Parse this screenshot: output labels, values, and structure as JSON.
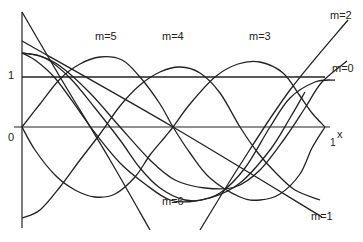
{
  "figure": {
    "axis_labels": {
      "y_one": "1",
      "origin": "0",
      "x_one": "1",
      "x_var": "x"
    },
    "curve_labels": [
      {
        "id": "m5",
        "text": "m=5",
        "x": 95,
        "y": 40
      },
      {
        "id": "m4",
        "text": "m=4",
        "x": 162,
        "y": 40
      },
      {
        "id": "m3",
        "text": "m=3",
        "x": 249,
        "y": 40
      },
      {
        "id": "m2",
        "text": "m=2",
        "x": 330,
        "y": 19
      },
      {
        "id": "m0",
        "text": "m=0",
        "x": 332,
        "y": 72
      },
      {
        "id": "m6",
        "text": "m=6",
        "x": 162,
        "y": 205
      },
      {
        "id": "m1",
        "text": "m=1",
        "x": 311,
        "y": 220
      }
    ],
    "color": "#222222",
    "curves": [
      {
        "name": "m0",
        "points": [
          [
            22,
            77
          ],
          [
            325,
            77
          ]
        ]
      },
      {
        "name": "m1",
        "points": [
          [
            22,
            41
          ],
          [
            173,
            127
          ],
          [
            322,
            217
          ]
        ]
      },
      {
        "name": "m2-descending",
        "points": [
          [
            22,
            12
          ],
          [
            60,
            77
          ],
          [
            110,
            160
          ],
          [
            150,
            230
          ]
        ]
      },
      {
        "name": "m2",
        "points": [
          [
            200,
            230
          ],
          [
            240,
            165
          ],
          [
            290,
            90
          ],
          [
            348,
            20
          ]
        ]
      },
      {
        "name": "m3",
        "points": [
          [
            22,
            53
          ],
          [
            40,
            56
          ],
          [
            60,
            66
          ],
          [
            90,
            93
          ],
          [
            120,
            127
          ],
          [
            150,
            160
          ],
          [
            175,
            180
          ],
          [
            205,
            188
          ],
          [
            235,
            187
          ],
          [
            260,
            170
          ],
          [
            285,
            138
          ],
          [
            305,
            108
          ],
          [
            322,
            82
          ],
          [
            347,
            61
          ]
        ]
      },
      {
        "name": "m4",
        "points": [
          [
            22,
            53
          ],
          [
            35,
            60
          ],
          [
            55,
            78
          ],
          [
            80,
            112
          ],
          [
            95,
            133
          ],
          [
            120,
            163
          ],
          [
            145,
            184
          ],
          [
            170,
            200
          ],
          [
            195,
            201
          ],
          [
            220,
            193
          ],
          [
            245,
            168
          ],
          [
            270,
            127
          ],
          [
            290,
            98
          ],
          [
            315,
            82
          ],
          [
            335,
            80
          ]
        ]
      },
      {
        "name": "m5",
        "points": [
          [
            22,
            127
          ],
          [
            40,
            104
          ],
          [
            60,
            79
          ],
          [
            80,
            64
          ],
          [
            100,
            57
          ],
          [
            122,
            60
          ],
          [
            140,
            77
          ],
          [
            160,
            104
          ],
          [
            173,
            127
          ],
          [
            190,
            153
          ],
          [
            210,
            178
          ],
          [
            240,
            197
          ],
          [
            260,
            200
          ],
          [
            280,
            194
          ],
          [
            300,
            174
          ],
          [
            312,
            148
          ],
          [
            325,
            127
          ]
        ]
      },
      {
        "name": "m4-arch",
        "points": [
          [
            22,
            218
          ],
          [
            40,
            210
          ],
          [
            60,
            187
          ],
          [
            80,
            160
          ],
          [
            100,
            134
          ],
          [
            120,
            106
          ],
          [
            140,
            85
          ],
          [
            160,
            72
          ],
          [
            180,
            67
          ],
          [
            200,
            73
          ],
          [
            220,
            93
          ],
          [
            240,
            127
          ],
          [
            258,
            153
          ],
          [
            275,
            172
          ],
          [
            295,
            190
          ],
          [
            320,
            200
          ]
        ]
      },
      {
        "name": "m6",
        "points": [
          [
            22,
            127
          ],
          [
            35,
            150
          ],
          [
            55,
            175
          ],
          [
            75,
            190
          ],
          [
            95,
            197
          ],
          [
            115,
            194
          ],
          [
            135,
            177
          ],
          [
            150,
            155
          ],
          [
            165,
            137
          ],
          [
            173,
            127
          ],
          [
            190,
            104
          ],
          [
            215,
            77
          ],
          [
            238,
            64
          ],
          [
            260,
            62
          ],
          [
            283,
            73
          ],
          [
            300,
            96
          ],
          [
            312,
            113
          ],
          [
            325,
            127
          ]
        ]
      },
      {
        "name": "m3-arch",
        "points": [
          [
            22,
            53
          ],
          [
            45,
            58
          ],
          [
            70,
            78
          ],
          [
            95,
            108
          ],
          [
            120,
            140
          ],
          [
            140,
            168
          ],
          [
            160,
            188
          ],
          [
            185,
            200
          ],
          [
            210,
            198
          ],
          [
            240,
            183
          ],
          [
            270,
            150
          ],
          [
            290,
            118
          ],
          [
            305,
            92
          ]
        ]
      }
    ]
  }
}
